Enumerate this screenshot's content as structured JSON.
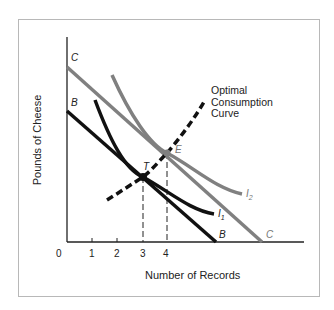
{
  "diagram": {
    "y_axis_label": "Pounds of Cheese",
    "x_axis_label": "Number of Records",
    "origin_label": "0",
    "x_ticks": [
      "1",
      "2",
      "3",
      "4"
    ],
    "budget_lines": [
      {
        "label": "B",
        "color": "#111111"
      },
      {
        "label": "C",
        "color": "#808080"
      }
    ],
    "indifference_curves": [
      {
        "label": "I",
        "subscript": "1",
        "color": "#111111"
      },
      {
        "label": "I",
        "subscript": "2",
        "color": "#808080"
      }
    ],
    "points": [
      {
        "label": "T",
        "x_value": "3"
      },
      {
        "label": "E",
        "x_value": "4"
      }
    ],
    "optimal_curve_label": [
      "Optimal",
      "Consumption",
      "Curve"
    ]
  }
}
